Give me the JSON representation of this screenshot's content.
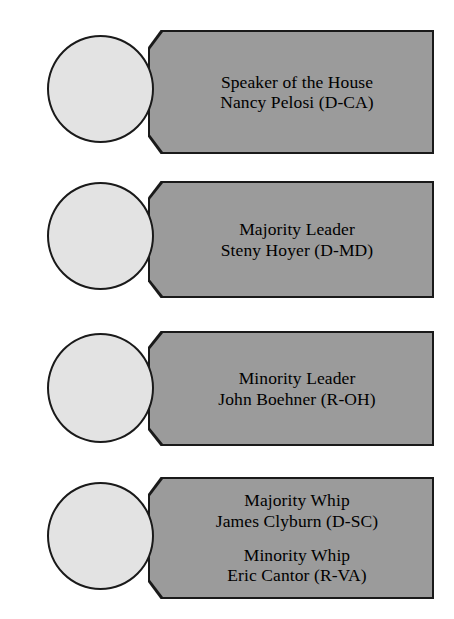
{
  "diagram": {
    "kind": "leadership-org-chart",
    "background_color": "#ffffff",
    "banner_color": "#9b9b9b",
    "circle_color": "#e3e3e3",
    "outline_color": "#1a1a1a",
    "text_color": "#000000",
    "rows": [
      {
        "id": "speaker",
        "entries": [
          {
            "title": "Speaker of the House",
            "name": "Nancy Pelosi (D-CA)"
          }
        ]
      },
      {
        "id": "majority-leader",
        "entries": [
          {
            "title": "Majority Leader",
            "name": "Steny Hoyer (D-MD)"
          }
        ]
      },
      {
        "id": "minority-leader",
        "entries": [
          {
            "title": "Minority Leader",
            "name": "John Boehner (R-OH)"
          }
        ]
      },
      {
        "id": "whips",
        "entries": [
          {
            "title": "Majority Whip",
            "name": "James Clyburn (D-SC)"
          },
          {
            "title": "Minority Whip",
            "name": "Eric Cantor (R-VA)"
          }
        ]
      }
    ]
  }
}
